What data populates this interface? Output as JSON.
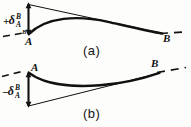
{
  "figure": {
    "background_color": "#fdfdfb",
    "ink_color": "#111111",
    "panels": [
      {
        "id": "a",
        "label": "(a)",
        "sign": "+",
        "delta_symbol": "δ",
        "delta_superscript": "B",
        "delta_subscript": "A",
        "deflection_label": "+δ",
        "point_start_label": "A",
        "point_end_label": "B",
        "dimension_tick_top_label": "B",
        "dimension_tick_bottom_label": "A",
        "curve_shape": "convex-upward",
        "description_curve": "elastic curve bulging above the chord from A to B",
        "description_tangent": "tangent line drawn at A sloping down to B",
        "description_dim_arrow": "double-headed vertical arrow at A measuring tangential deviation",
        "dashed_reference_left": true,
        "dashed_reference_right": true
      },
      {
        "id": "b",
        "label": "(b)",
        "sign": "−",
        "delta_symbol": "δ",
        "delta_superscript": "B",
        "delta_subscript": "A",
        "deflection_label": "−δ",
        "point_start_label": "A",
        "point_end_label": "B",
        "dimension_tick_top_label": "B",
        "dimension_tick_bottom_label": "A",
        "curve_shape": "concave-upward",
        "description_curve": "elastic curve sagging below the chord from A to B",
        "description_tangent": "tangent line drawn at A sloping up to B",
        "description_dim_arrow": "double-headed vertical arrow at A measuring tangential deviation",
        "dashed_reference_left": true,
        "dashed_reference_right": true
      }
    ]
  }
}
